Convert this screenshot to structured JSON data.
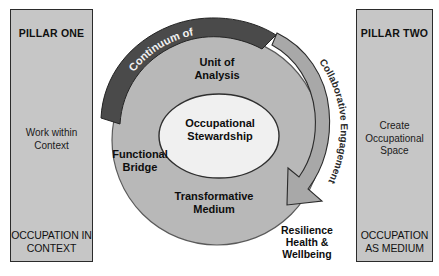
{
  "diagram": {
    "title_hidden": "",
    "background_color": "#ffffff",
    "colors": {
      "pillar_fill": "#c6c6c6",
      "pillar_border": "#2b2b2b",
      "outer_ring": "#b8b8b8",
      "inner_ellipse": "#f0f0f0",
      "dark_arc": "#4a4a4a",
      "gray_arrow": "#a8a8a8",
      "text_dark": "#0d0d0d",
      "text_light": "#f2f2f2"
    }
  },
  "pillar_one": {
    "title": "PILLAR ONE",
    "middle_text": "Work within\nContext",
    "bottom_text": "OCCUPATION\nIN CONTEXT"
  },
  "pillar_two": {
    "title": "PILLAR TWO",
    "middle_text": "Create\nOccupational\nSpace",
    "bottom_text": "OCCUPATION\nAS MEDIUM"
  },
  "center": {
    "core_label": "Occupational\nStewardship",
    "unit_of_analysis": "Unit of\nAnalysis",
    "functional_bridge": "Functional\nBridge",
    "transformative_medium": "Transformative\nMedium",
    "resilience": "Resilience\nHealth &\nWellbeing"
  },
  "arcs": {
    "continuum": "Continuum of",
    "collaborative": "Collaborative Engagement"
  }
}
